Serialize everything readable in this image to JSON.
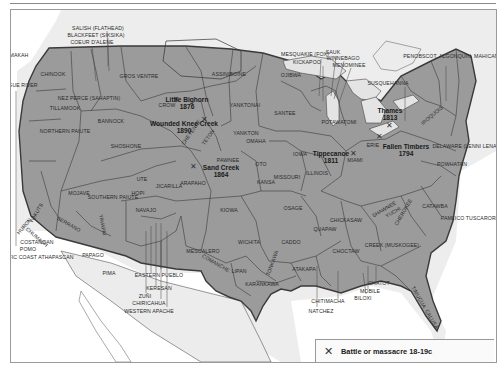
{
  "map": {
    "title": "Native American tribal territories",
    "colors": {
      "territory": "#9b9b9b",
      "ocean": "#ffffff",
      "outside_land": "#ededed",
      "lakes": "#e6e6e6",
      "border": "#3a3a3a"
    },
    "tribes": [
      {
        "name": "SALISH (FLATHEAD)",
        "x": 97,
        "y": 27
      },
      {
        "name": "BLACKFEET (SIKSIKA)",
        "x": 95,
        "y": 34
      },
      {
        "name": "COEUR D'ALENE",
        "x": 91,
        "y": 41
      },
      {
        "name": "MAKAH",
        "x": 18,
        "y": 54
      },
      {
        "name": "CHINOOK",
        "x": 52,
        "y": 73
      },
      {
        "name": "GROS VENTRE",
        "x": 138,
        "y": 75
      },
      {
        "name": "ASSINIBOINE",
        "x": 228,
        "y": 73
      },
      {
        "name": "OJIBWA",
        "x": 290,
        "y": 74
      },
      {
        "name": "ROGUE RIVER",
        "x": 18,
        "y": 84
      },
      {
        "name": "NEZ PERCE (SAHAPTIN)",
        "x": 88,
        "y": 97
      },
      {
        "name": "TILLAMOOK",
        "x": 64,
        "y": 107
      },
      {
        "name": "CROW",
        "x": 166,
        "y": 104
      },
      {
        "name": "YANKTONAI",
        "x": 244,
        "y": 104
      },
      {
        "name": "SANTEE",
        "x": 284,
        "y": 112
      },
      {
        "name": "BANNOCK",
        "x": 110,
        "y": 120
      },
      {
        "name": "NORTHERN PAIUTE",
        "x": 64,
        "y": 130
      },
      {
        "name": "SHOSHONE",
        "x": 125,
        "y": 145
      },
      {
        "name": "YANKTON",
        "x": 245,
        "y": 132
      },
      {
        "name": "OMAHA",
        "x": 255,
        "y": 140
      },
      {
        "name": "IOWA",
        "x": 299,
        "y": 153
      },
      {
        "name": "PAWNEE",
        "x": 227,
        "y": 159
      },
      {
        "name": "OTO",
        "x": 260,
        "y": 163
      },
      {
        "name": "KANSA",
        "x": 265,
        "y": 181
      },
      {
        "name": "MISSOURI",
        "x": 286,
        "y": 176
      },
      {
        "name": "ILLINOIS",
        "x": 316,
        "y": 172
      },
      {
        "name": "ARAPAHO",
        "x": 192,
        "y": 182
      },
      {
        "name": "UTE",
        "x": 141,
        "y": 178
      },
      {
        "name": "JICARILLA",
        "x": 168,
        "y": 185
      },
      {
        "name": "MOJAVE",
        "x": 78,
        "y": 192
      },
      {
        "name": "SOUTHERN PAIUTE",
        "x": 112,
        "y": 196
      },
      {
        "name": "HOPI",
        "x": 137,
        "y": 192
      },
      {
        "name": "NAVAJO",
        "x": 145,
        "y": 209
      },
      {
        "name": "KIOWA",
        "x": 228,
        "y": 209
      },
      {
        "name": "OSAGE",
        "x": 292,
        "y": 207
      },
      {
        "name": "MIAMI",
        "x": 354,
        "y": 159
      },
      {
        "name": "DELAWARE (LENNI LENAPE)",
        "x": 468,
        "y": 145
      },
      {
        "name": "POWHATAN",
        "x": 451,
        "y": 163
      },
      {
        "name": "CATAWBA",
        "x": 434,
        "y": 205
      },
      {
        "name": "CHICKASAW",
        "x": 345,
        "y": 219
      },
      {
        "name": "PAMLICO TUSCARORA",
        "x": 469,
        "y": 217
      },
      {
        "name": "QUAPAW",
        "x": 324,
        "y": 228
      },
      {
        "name": "CREEK (MUSKOGEE)",
        "x": 391,
        "y": 244
      },
      {
        "name": "WICHITA",
        "x": 248,
        "y": 241
      },
      {
        "name": "CADDO",
        "x": 290,
        "y": 241
      },
      {
        "name": "CHOCTAW",
        "x": 345,
        "y": 250
      },
      {
        "name": "MESCALERO",
        "x": 202,
        "y": 250
      },
      {
        "name": "LIPAN",
        "x": 238,
        "y": 270
      },
      {
        "name": "ATAKAPA",
        "x": 303,
        "y": 268
      },
      {
        "name": "KARANKAWA",
        "x": 261,
        "y": 283
      },
      {
        "name": "CHITIMACHA",
        "x": 327,
        "y": 300
      },
      {
        "name": "NATCHEZ",
        "x": 320,
        "y": 310
      },
      {
        "name": "CHATOT",
        "x": 378,
        "y": 282
      },
      {
        "name": "MOBILE",
        "x": 369,
        "y": 290
      },
      {
        "name": "BILOXI",
        "x": 362,
        "y": 297
      },
      {
        "name": "POTAWATOMI",
        "x": 338,
        "y": 121
      },
      {
        "name": "MESQUAKIE (FOX)",
        "x": 304,
        "y": 53
      },
      {
        "name": "KICKAPOO",
        "x": 306,
        "y": 61
      },
      {
        "name": "SAUK",
        "x": 332,
        "y": 51
      },
      {
        "name": "WINNEBAGO",
        "x": 342,
        "y": 57
      },
      {
        "name": "MENOMINEE",
        "x": 348,
        "y": 64
      },
      {
        "name": "SUSQUEHANNA",
        "x": 387,
        "y": 82
      },
      {
        "name": "PENOBSCOT, ALGONQUIN, MAHICAN",
        "x": 450,
        "y": 55
      },
      {
        "name": "COSTANOAN",
        "x": 36,
        "y": 241
      },
      {
        "name": "POMO",
        "x": 27,
        "y": 248
      },
      {
        "name": "PACIFIC COAST ATHAPASCAN",
        "x": 34,
        "y": 256
      },
      {
        "name": "PAPAGO",
        "x": 92,
        "y": 254
      },
      {
        "name": "PIMA",
        "x": 108,
        "y": 272
      },
      {
        "name": "EASTERN PUEBLO",
        "x": 158,
        "y": 274
      },
      {
        "name": "KERESAN",
        "x": 158,
        "y": 287
      },
      {
        "name": "ZUÑI",
        "x": 144,
        "y": 295
      },
      {
        "name": "CHIRICAHUA",
        "x": 148,
        "y": 302
      },
      {
        "name": "WESTERN APACHE",
        "x": 148,
        "y": 310
      },
      {
        "name": "ERIE",
        "x": 372,
        "y": 144
      }
    ],
    "rotated_labels": [
      {
        "name": "CHEYENNE",
        "x": 190,
        "y": 131,
        "angle": -55
      },
      {
        "name": "TETON",
        "x": 207,
        "y": 136,
        "angle": -55
      },
      {
        "name": "HURON",
        "x": 23,
        "y": 225,
        "angle": -50
      },
      {
        "name": "CHUMASH",
        "x": 36,
        "y": 236,
        "angle": 40
      },
      {
        "name": "YOKUTS",
        "x": 35,
        "y": 212,
        "angle": -60
      },
      {
        "name": "SERRANO",
        "x": 68,
        "y": 223,
        "angle": 30
      },
      {
        "name": "YAVAPAI",
        "x": 102,
        "y": 224,
        "angle": 80
      },
      {
        "name": "COMANCHE",
        "x": 215,
        "y": 262,
        "angle": 30
      },
      {
        "name": "TONKAWA",
        "x": 271,
        "y": 262,
        "angle": -70
      },
      {
        "name": "SHAWNEE",
        "x": 383,
        "y": 208,
        "angle": -30
      },
      {
        "name": "YUCHI",
        "x": 392,
        "y": 211,
        "angle": -30
      },
      {
        "name": "CHEROKEE",
        "x": 402,
        "y": 211,
        "angle": -60
      },
      {
        "name": "IROQUOIS",
        "x": 431,
        "y": 114,
        "angle": -40
      },
      {
        "name": "TIMUCUA",
        "x": 418,
        "y": 296,
        "angle": 60
      },
      {
        "name": "CALUSA",
        "x": 431,
        "y": 318,
        "angle": 60
      }
    ],
    "battles": [
      {
        "name": "Little Bighorn",
        "year": "1876",
        "x": 186,
        "y": 99,
        "mx": 175,
        "my": 99
      },
      {
        "name": "Wounded Knee Creek",
        "year": "1890",
        "x": 183,
        "y": 123,
        "mx": 203,
        "my": 119
      },
      {
        "name": "Sand Creek",
        "year": "1864",
        "x": 220,
        "y": 167,
        "mx": 192,
        "my": 166
      },
      {
        "name": "Tippecanoe",
        "year": "1811",
        "x": 330,
        "y": 153,
        "mx": 352,
        "my": 153
      },
      {
        "name": "Thames",
        "year": "1813",
        "x": 389,
        "y": 110,
        "mx": 388,
        "my": 125
      },
      {
        "name": "Fallen Timbers",
        "year": "1794",
        "x": 405,
        "y": 146,
        "mx": 378,
        "my": 136
      }
    ],
    "legend": {
      "icon": "crossed-swords-icon",
      "label": "Battle or massacre 18-19c"
    }
  }
}
